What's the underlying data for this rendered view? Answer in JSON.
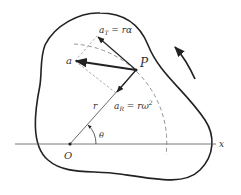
{
  "diagram": {
    "labels": {
      "point": "P",
      "origin": "O",
      "x_axis": "x",
      "radius": "r",
      "angle": "θ",
      "total_accel": "a",
      "tangential_accel_sym": "a",
      "tangential_sub": "T",
      "tangential_rhs": " = rα",
      "radial_accel_sym": "a",
      "radial_sub": "R",
      "radial_rhs": " = rω",
      "radial_sup": "2"
    },
    "colors": {
      "stroke": "#222222",
      "dashed": "#777777",
      "text": "#333333"
    }
  }
}
